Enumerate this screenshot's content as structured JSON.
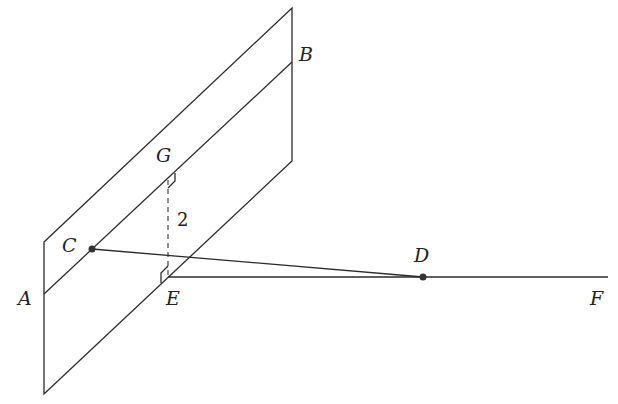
{
  "diagram": {
    "type": "3D geometry: plane with point outside, perpendicular distance",
    "labels": {
      "A": "A",
      "B": "B",
      "C": "C",
      "D": "D",
      "E": "E",
      "F": "F",
      "G": "G"
    },
    "distance_label": "2",
    "points": {
      "A": [
        44,
        294
      ],
      "B": [
        292,
        62
      ],
      "C": [
        92,
        249
      ],
      "D": [
        423,
        277
      ],
      "E": [
        168,
        277
      ],
      "F": [
        608,
        277
      ],
      "G": [
        168,
        178
      ]
    },
    "plane_corners": [
      [
        44,
        242
      ],
      [
        292,
        8
      ],
      [
        292,
        161
      ],
      [
        44,
        394
      ]
    ],
    "segments": [
      {
        "from": "A",
        "to": "B",
        "style": "solid"
      },
      {
        "from": "C",
        "to": "D",
        "style": "solid"
      },
      {
        "from": "E",
        "to": "F",
        "style": "solid"
      },
      {
        "from": "G",
        "to": "E",
        "style": "dashed"
      }
    ],
    "right_angles": [
      "G",
      "E"
    ]
  }
}
